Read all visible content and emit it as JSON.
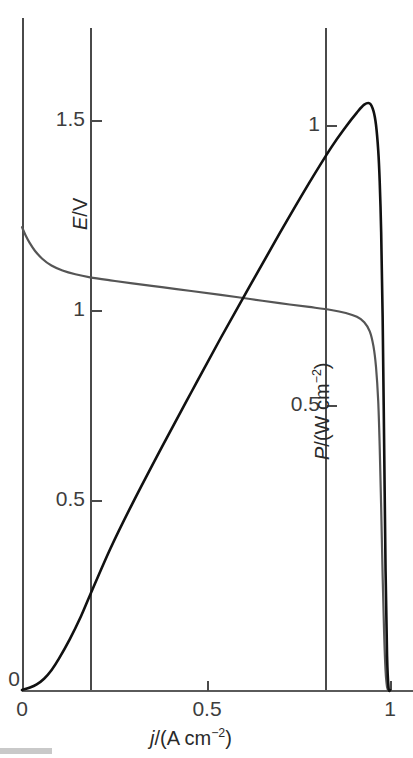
{
  "chart_data": {
    "type": "line",
    "title": "",
    "xlabel": "j/(A cm−2)",
    "xlabel_parts": {
      "symbol": "j",
      "rest": "/(A cm",
      "exp": "−2",
      "close": ")"
    },
    "ylabel_left": "E/V",
    "ylabel_right": "P/(W cm−2)",
    "ylabel_right_parts": {
      "symbol": "P",
      "rest": "/(W cm",
      "exp": "−2",
      "close": ")"
    },
    "x": [
      0,
      0.2,
      0.5,
      0.83,
      1
    ],
    "xlim": [
      0,
      1.06
    ],
    "xticks": [
      0,
      0.5,
      1
    ],
    "xticklabels": [
      "0",
      "0.5",
      "1"
    ],
    "grid": true,
    "gridlines_x": [
      0.185,
      0.823
    ],
    "legend": "none",
    "axis_left": {
      "label": "E/V",
      "ticks": [
        0,
        0.5,
        1,
        1.5
      ],
      "ticklabels": [
        "0",
        "0.5",
        "1",
        "1.5"
      ],
      "ylim": [
        0,
        1.78
      ],
      "color": "#555555"
    },
    "axis_right": {
      "label": "P/(W cm−2)",
      "ticks": [
        0.5,
        1
      ],
      "ticklabels": [
        "0.5",
        "1"
      ],
      "ylim": [
        0,
        1.21
      ],
      "color": "#111111"
    },
    "series": [
      {
        "name": "E/V",
        "axis": "left",
        "color": "#555555",
        "points": [
          [
            0.0,
            1.218
          ],
          [
            0.01,
            1.196
          ],
          [
            0.02,
            1.178
          ],
          [
            0.035,
            1.156
          ],
          [
            0.055,
            1.135
          ],
          [
            0.08,
            1.117
          ],
          [
            0.11,
            1.104
          ],
          [
            0.145,
            1.094
          ],
          [
            0.185,
            1.086
          ],
          [
            0.24,
            1.078
          ],
          [
            0.3,
            1.07
          ],
          [
            0.38,
            1.06
          ],
          [
            0.46,
            1.05
          ],
          [
            0.54,
            1.04
          ],
          [
            0.62,
            1.029
          ],
          [
            0.7,
            1.018
          ],
          [
            0.78,
            1.008
          ],
          [
            0.84,
            1.0
          ],
          [
            0.88,
            0.992
          ],
          [
            0.91,
            0.982
          ],
          [
            0.93,
            0.968
          ],
          [
            0.945,
            0.944
          ],
          [
            0.955,
            0.905
          ],
          [
            0.962,
            0.85
          ],
          [
            0.968,
            0.76
          ],
          [
            0.972,
            0.64
          ],
          [
            0.976,
            0.48
          ],
          [
            0.98,
            0.3
          ],
          [
            0.984,
            0.15
          ],
          [
            0.988,
            0.05
          ],
          [
            0.992,
            0.008
          ],
          [
            0.996,
            0.0
          ]
        ]
      },
      {
        "name": "P/(W cm−2)",
        "axis": "right",
        "color": "#111111",
        "points": [
          [
            0.0,
            0.0
          ],
          [
            0.02,
            0.004
          ],
          [
            0.04,
            0.01
          ],
          [
            0.06,
            0.02
          ],
          [
            0.08,
            0.035
          ],
          [
            0.1,
            0.055
          ],
          [
            0.13,
            0.09
          ],
          [
            0.16,
            0.13
          ],
          [
            0.185,
            0.168
          ],
          [
            0.24,
            0.25
          ],
          [
            0.3,
            0.33
          ],
          [
            0.38,
            0.43
          ],
          [
            0.46,
            0.527
          ],
          [
            0.54,
            0.623
          ],
          [
            0.62,
            0.716
          ],
          [
            0.7,
            0.808
          ],
          [
            0.78,
            0.897
          ],
          [
            0.84,
            0.96
          ],
          [
            0.88,
            0.997
          ],
          [
            0.91,
            1.022
          ],
          [
            0.93,
            1.036
          ],
          [
            0.945,
            1.038
          ],
          [
            0.955,
            1.025
          ],
          [
            0.962,
            1.0
          ],
          [
            0.968,
            0.955
          ],
          [
            0.972,
            0.9
          ],
          [
            0.976,
            0.81
          ],
          [
            0.98,
            0.66
          ],
          [
            0.984,
            0.44
          ],
          [
            0.988,
            0.21
          ],
          [
            0.992,
            0.06
          ],
          [
            0.996,
            0.004
          ],
          [
            1.0,
            0.0
          ]
        ]
      }
    ],
    "annotations": {
      "peak_power": {
        "x": 0.94,
        "y": 1.04
      },
      "open_circuit_voltage": {
        "x": 0.0,
        "y": 1.22
      }
    }
  },
  "axes": {
    "left_ticks": [
      {
        "label": "1.5",
        "value": 1.5
      },
      {
        "label": "1",
        "value": 1.0
      },
      {
        "label": "0.5",
        "value": 0.5
      },
      {
        "label": "0",
        "value": 0.0
      }
    ],
    "right_ticks": [
      {
        "label": "1",
        "value": 1.0
      },
      {
        "label": "0.5",
        "value": 0.5
      }
    ],
    "x_ticks": [
      {
        "label": "0",
        "value": 0.0
      },
      {
        "label": "0.5",
        "value": 0.5
      },
      {
        "label": "1",
        "value": 1.0
      }
    ]
  }
}
